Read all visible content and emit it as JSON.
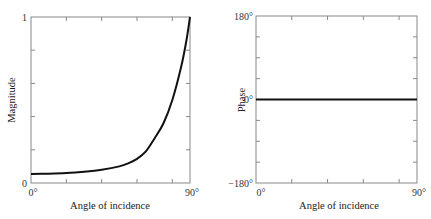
{
  "chart_data": [
    {
      "type": "line",
      "title": "",
      "xlabel": "Angle of incidence",
      "ylabel": "Magnitude",
      "xlim": [
        0,
        90
      ],
      "ylim": [
        0,
        1
      ],
      "x_tick_labels": [
        "0°",
        "90°"
      ],
      "y_tick_labels": [
        "0",
        "1"
      ],
      "x_minor_ticks": [
        20,
        40,
        60,
        80
      ],
      "y_minor_ticks": [
        0.2,
        0.4,
        0.6,
        0.8
      ],
      "grid": false,
      "series": [
        {
          "name": "Magnitude",
          "x": [
            0,
            10,
            20,
            30,
            40,
            50,
            55,
            60,
            65,
            70,
            75,
            80,
            85,
            88,
            90
          ],
          "y": [
            0.054,
            0.056,
            0.06,
            0.068,
            0.08,
            0.1,
            0.118,
            0.145,
            0.19,
            0.27,
            0.36,
            0.5,
            0.7,
            0.86,
            1.0
          ]
        }
      ]
    },
    {
      "type": "line",
      "title": "",
      "xlabel": "Angle of incidence",
      "ylabel": "Phase",
      "xlim": [
        0,
        90
      ],
      "ylim": [
        -180,
        180
      ],
      "x_tick_labels": [
        "0°",
        "90°"
      ],
      "y_tick_labels": [
        "−180°",
        "0°",
        "180°"
      ],
      "x_minor_ticks": [
        20,
        40,
        60,
        80
      ],
      "y_minor_ticks": [
        -135,
        -90,
        -45,
        45,
        90,
        135
      ],
      "grid": false,
      "series": [
        {
          "name": "Phase",
          "x": [
            0,
            90
          ],
          "y": [
            0,
            0
          ]
        }
      ]
    }
  ],
  "left": {
    "ylabel": "Magnitude",
    "xlabel": "Angle of incidence",
    "y_top": "1",
    "y_bottom": "0",
    "x_left": "0°",
    "x_right": "90°"
  },
  "right": {
    "ylabel": "Phase",
    "xlabel": "Angle of incidence",
    "y_top": "180°",
    "y_mid": "0°",
    "y_bottom": "−180°",
    "x_left": "0°",
    "x_right": "90°"
  }
}
